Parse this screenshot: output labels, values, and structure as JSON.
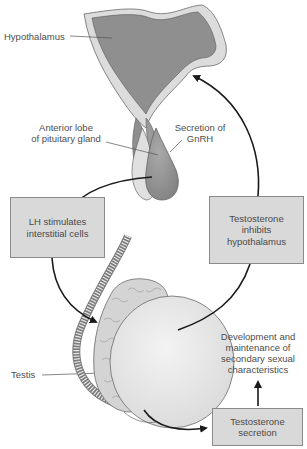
{
  "labels": {
    "hypothalamus": "Hypothalamus",
    "anterior_lobe_line1": "Anterior lobe",
    "anterior_lobe_line2": "of pituitary gland",
    "secretion_line1": "Secretion of",
    "secretion_line2": "GnRH",
    "testis": "Testis",
    "development_lines": [
      "Development and",
      "maintenance of",
      "secondary sexual",
      "characteristics"
    ]
  },
  "boxes": {
    "lh": [
      "LH stimulates",
      "interstitial cells"
    ],
    "inhibits": [
      "Testosterone",
      "inhibits",
      "hypothalamus"
    ],
    "secretion": [
      "Testosterone",
      "secretion"
    ]
  },
  "colors": {
    "tissue_dark": "#8f8f8f",
    "tissue_mid": "#a8a8a8",
    "tissue_light": "#dcdcdc",
    "testis_fill": "#ececec",
    "box_fill": "#d9d9d9",
    "arrow": "#1a1a1a"
  }
}
